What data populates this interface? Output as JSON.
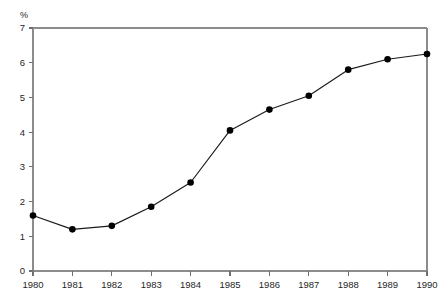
{
  "chart_data": {
    "type": "line",
    "title": "",
    "subtitle": "",
    "xlabel": "",
    "ylabel": "%",
    "unit_label": "%",
    "categories": [
      "1980",
      "1981",
      "1982",
      "1983",
      "1984",
      "1985",
      "1986",
      "1987",
      "1988",
      "1989",
      "1990"
    ],
    "x": [
      1980,
      1981,
      1982,
      1983,
      1984,
      1985,
      1986,
      1987,
      1988,
      1989,
      1990
    ],
    "values": [
      1.6,
      1.2,
      1.3,
      1.85,
      2.55,
      4.05,
      4.65,
      5.05,
      5.8,
      6.1,
      6.25
    ],
    "series": [
      {
        "name": "",
        "values": [
          1.6,
          1.2,
          1.3,
          1.85,
          2.55,
          4.05,
          4.65,
          5.05,
          5.8,
          6.1,
          6.25
        ]
      }
    ],
    "ylim": [
      0,
      7
    ],
    "xlim": [
      1980,
      1990
    ],
    "y_ticks": [
      0,
      1,
      2,
      3,
      4,
      5,
      6,
      7
    ],
    "y_tick_labels": [
      "0",
      "1",
      "2",
      "3",
      "4",
      "5",
      "6",
      "7"
    ],
    "x_ticks": [
      1980,
      1981,
      1982,
      1983,
      1984,
      1985,
      1986,
      1987,
      1988,
      1989,
      1990
    ],
    "x_tick_labels": [
      "1980",
      "1981",
      "1982",
      "1983",
      "1984",
      "1985",
      "1986",
      "1987",
      "1988",
      "1989",
      "1990"
    ],
    "grid": false,
    "legend": false,
    "legend_position": "none",
    "marker": "filled-circle",
    "colors": {
      "series_line": "#1a1a1a",
      "marker": "#000000",
      "axis": "#8c8c8c",
      "tick": "#6f6f6f",
      "text": "#1f1f1f",
      "background": "#ffffff"
    }
  },
  "layout": {
    "plot_left": 33,
    "plot_right": 427,
    "plot_top": 28,
    "plot_bottom": 271
  }
}
